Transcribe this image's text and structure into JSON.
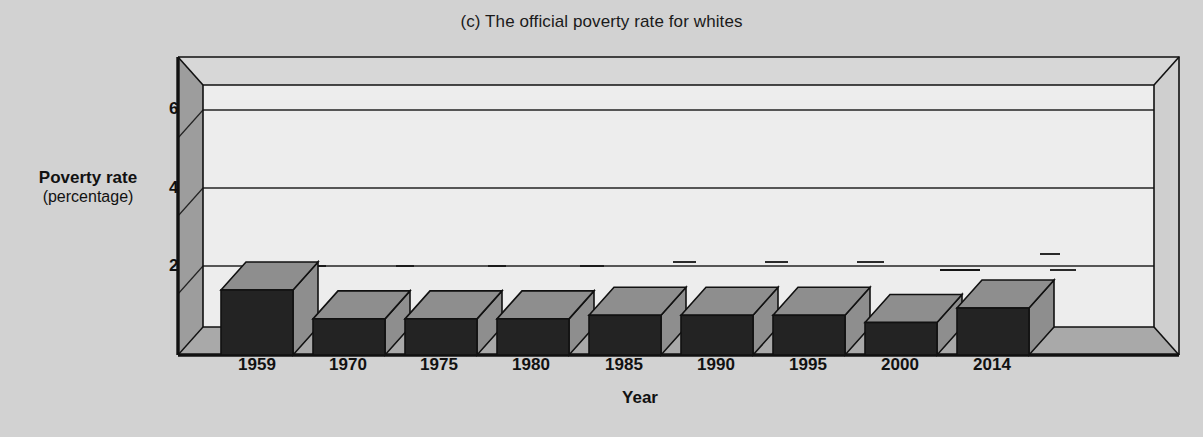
{
  "chart_data": {
    "type": "bar",
    "title": "(c) The official poverty rate for whites",
    "xlabel": "Year",
    "ylabel": "Poverty rate",
    "ylabel_sub": "(percentage)",
    "categories": [
      "1959",
      "1970",
      "1975",
      "1980",
      "1985",
      "1990",
      "1995",
      "2000",
      "2014"
    ],
    "values": [
      18,
      10,
      10,
      10,
      11,
      11,
      11,
      9,
      13
    ],
    "data_labels": [
      "18%",
      "10%",
      "10%",
      "10%",
      "11%",
      "11%",
      "11%",
      "9%",
      "13%"
    ],
    "yticks": [
      0,
      20,
      40,
      60
    ],
    "ytick_labels": [
      "0",
      "20",
      "40",
      "60"
    ],
    "ylim": [
      0,
      70
    ],
    "grid": true,
    "legend": "none",
    "style": "3d-bar",
    "colors": {
      "background": "#d2d2d2",
      "bar_front": "#232323",
      "bar_top": "#8e8e8e",
      "bar_side": "#8e8e8e",
      "plot_back_wall": "#ececec",
      "plot_left_wall": "#9a9a9a",
      "plot_right_wall": "#c8c8c8",
      "floor": "#a8a8a8",
      "axis_line": "#111111",
      "gridline": "#222222",
      "text": "#111111"
    }
  }
}
